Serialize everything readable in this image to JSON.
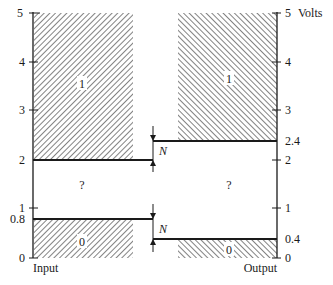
{
  "diagram": {
    "units_label": "Volts",
    "input_axis": {
      "label": "Input",
      "ticks": [
        "0",
        "1",
        "2",
        "3",
        "4",
        "5"
      ],
      "special_ticks": [
        "0.8"
      ]
    },
    "output_axis": {
      "label": "Output",
      "ticks": [
        "0",
        "1",
        "2",
        "3",
        "4",
        "5"
      ],
      "special_ticks": [
        "0.4",
        "2.4"
      ]
    },
    "regions": {
      "input_high": "1",
      "input_undefined": "?",
      "input_low": "0",
      "output_high": "1",
      "output_undefined": "?",
      "output_low": "0"
    },
    "noise_margin_label": "N",
    "levels": {
      "input_high_min": 2.0,
      "input_low_max": 0.8,
      "output_high_min": 2.4,
      "output_low_max": 0.4
    }
  },
  "colors": {
    "ink": "#1a1a1a",
    "background": "#ffffff"
  }
}
